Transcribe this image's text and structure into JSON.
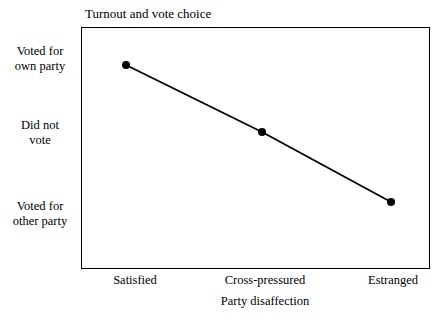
{
  "chart_data": {
    "type": "line",
    "title": "Turnout and vote choice",
    "xlabel": "Party disaffection",
    "ylabel": "",
    "categories": [
      "Satisfied",
      "Cross-pressured",
      "Estranged"
    ],
    "ytick_labels": [
      "Voted for own party",
      "Did not vote",
      "Voted for other party"
    ],
    "ytick_lines": [
      [
        "Voted for",
        "own party"
      ],
      [
        "Did not",
        "vote"
      ],
      [
        "Voted for",
        "other party"
      ]
    ],
    "values": [
      3,
      2,
      1
    ],
    "ylim": [
      0.55,
      3.35
    ],
    "grid": false,
    "legend": false,
    "series": [
      {
        "name": "Turnout and vote choice",
        "values": [
          3,
          2,
          1
        ],
        "marker": "filled-circle",
        "marker_size": 8,
        "line_width": 1.8,
        "color": "#000000"
      }
    ],
    "points": [
      {
        "x": "Satisfied",
        "y": 3,
        "px": 126,
        "py": 65
      },
      {
        "x": "Cross-pressured",
        "y": 2,
        "px": 262,
        "py": 132
      },
      {
        "x": "Estranged",
        "y": 1,
        "px": 391,
        "py": 202
      }
    ],
    "xtick_positions_px": [
      135,
      265,
      393
    ],
    "plot_area_px": {
      "left": 81,
      "top": 27,
      "width": 349,
      "height": 242
    },
    "colors": {
      "line": "#000000",
      "marker": "#000000",
      "frame": "#000000",
      "background": "#ffffff",
      "text": "#000000"
    }
  }
}
